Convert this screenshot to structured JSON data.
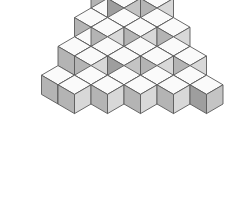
{
  "figure": {
    "background": "#ffffff"
  },
  "colors": {
    "top_face": "#fafafa",
    "left_face": "#b4b4b4",
    "right_face": "#d8d8d8",
    "left_face_dark": "#9e9e9e",
    "right_face_dark": "#c4c4c4",
    "edge": "#5a5a5a",
    "background": "#ffffff"
  },
  "projection": {
    "origin_x": 124,
    "origin_y": 8,
    "half_width": 16.5,
    "half_height": 9.6,
    "cube_height": 19.2,
    "type": "isometric"
  },
  "chart_data": {
    "type": "scatter",
    "xlabel": "grid-x",
    "ylabel": "grid-y",
    "zlabel": "level",
    "cube_count": 38,
    "cubes": [
      {
        "x": 0,
        "y": 0,
        "z": 3
      },
      {
        "x": 1,
        "y": 0,
        "z": 3
      },
      {
        "x": 0,
        "y": 1,
        "z": 2
      },
      {
        "x": 1,
        "y": 1,
        "z": 2
      },
      {
        "x": 2,
        "y": 0,
        "z": 2
      },
      {
        "x": 0,
        "y": 0,
        "z": 2
      },
      {
        "x": 0,
        "y": 2,
        "z": 1
      },
      {
        "x": 1,
        "y": 2,
        "z": 1
      },
      {
        "x": 2,
        "y": 1,
        "z": 1
      },
      {
        "x": 3,
        "y": 0,
        "z": 1
      },
      {
        "x": 1,
        "y": 0,
        "z": 1
      },
      {
        "x": 0,
        "y": 1,
        "z": 1
      },
      {
        "x": 2,
        "y": 0,
        "z": 1
      },
      {
        "x": 1,
        "y": 1,
        "z": 1
      },
      {
        "x": 0,
        "y": 3,
        "z": 0
      },
      {
        "x": 1,
        "y": 3,
        "z": 0
      },
      {
        "x": 2,
        "y": 2,
        "z": 0
      },
      {
        "x": 3,
        "y": 1,
        "z": 0
      },
      {
        "x": 4,
        "y": 0,
        "z": 0
      },
      {
        "x": 0,
        "y": 2,
        "z": 0
      },
      {
        "x": 1,
        "y": 2,
        "z": 0
      },
      {
        "x": 2,
        "y": 1,
        "z": 0
      },
      {
        "x": 3,
        "y": 0,
        "z": 0
      },
      {
        "x": 0,
        "y": 1,
        "z": 0
      },
      {
        "x": 1,
        "y": 1,
        "z": 0
      },
      {
        "x": 2,
        "y": 0,
        "z": 0
      },
      {
        "x": 0,
        "y": 0,
        "z": 0
      },
      {
        "x": 1,
        "y": 0,
        "z": 0
      },
      {
        "x": 0,
        "y": 4,
        "z": -1
      },
      {
        "x": 1,
        "y": 4,
        "z": -1
      },
      {
        "x": 2,
        "y": 3,
        "z": -1
      },
      {
        "x": 3,
        "y": 2,
        "z": -1
      },
      {
        "x": 4,
        "y": 1,
        "z": -1
      },
      {
        "x": 5,
        "y": 0,
        "z": -1
      },
      {
        "x": 2,
        "y": 2,
        "z": -1
      },
      {
        "x": 3,
        "y": 1,
        "z": -1
      },
      {
        "x": 4,
        "y": 0,
        "z": -1
      },
      {
        "x": 1,
        "y": 3,
        "z": -1
      }
    ]
  }
}
